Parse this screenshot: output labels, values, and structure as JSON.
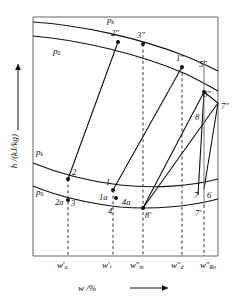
{
  "diagram": {
    "type": "enthalpy-concentration",
    "axes": {
      "y_label": "h /(kJ/kg)",
      "y_arrow": "↑",
      "x_label": "w /%",
      "x_arrow": "⟶"
    },
    "isobar_labels": [
      {
        "id": "pk-vapor",
        "base": "p",
        "sub": "k"
      },
      {
        "id": "p0-vapor",
        "base": "p",
        "sub": "0"
      },
      {
        "id": "pk-liquid",
        "base": "p",
        "sub": "k"
      },
      {
        "id": "p0-liquid",
        "base": "p",
        "sub": "0"
      }
    ],
    "x_ticks": [
      {
        "base": "w",
        "prime": "′",
        "sub": "a"
      },
      {
        "base": "w",
        "prime": "′",
        "sub": "r"
      },
      {
        "base": "w",
        "prime": "″",
        "sub": "m"
      },
      {
        "base": "w",
        "prime": "″",
        "sub": "d"
      },
      {
        "base": "w",
        "prime": "″",
        "sub": "Rn"
      }
    ],
    "state_points": [
      {
        "label": "2″"
      },
      {
        "label": "3″"
      },
      {
        "label": "1″"
      },
      {
        "label": "5″"
      },
      {
        "label": "8″"
      },
      {
        "label": "7″"
      },
      {
        "label": "8"
      },
      {
        "label": "2"
      },
      {
        "label": "1"
      },
      {
        "label": "1a"
      },
      {
        "label": "4a"
      },
      {
        "label": "2a"
      },
      {
        "label": "3"
      },
      {
        "label": "4"
      },
      {
        "label": "8′"
      },
      {
        "label": "7"
      },
      {
        "label": "6"
      },
      {
        "label": "7′"
      }
    ],
    "colors": {
      "line": "#1a1a1a",
      "frame": "#555555",
      "text": "#111111"
    }
  }
}
